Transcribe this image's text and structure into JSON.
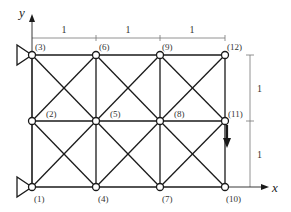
{
  "diagram": {
    "type": "truss",
    "axes": {
      "x_label": "x",
      "y_label": "y"
    },
    "nodes": [
      {
        "id": 1,
        "label": "(1)",
        "x": 32,
        "y": 187
      },
      {
        "id": 2,
        "label": "(2)",
        "x": 32,
        "y": 121
      },
      {
        "id": 3,
        "label": "(3)",
        "x": 32,
        "y": 55
      },
      {
        "id": 4,
        "label": "(4)",
        "x": 96,
        "y": 187
      },
      {
        "id": 5,
        "label": "(5)",
        "x": 96,
        "y": 121
      },
      {
        "id": 6,
        "label": "(6)",
        "x": 96,
        "y": 55
      },
      {
        "id": 7,
        "label": "(7)",
        "x": 160,
        "y": 187
      },
      {
        "id": 8,
        "label": "(8)",
        "x": 160,
        "y": 121
      },
      {
        "id": 9,
        "label": "(9)",
        "x": 160,
        "y": 55
      },
      {
        "id": 10,
        "label": "(10)",
        "x": 225,
        "y": 187
      },
      {
        "id": 11,
        "label": "(11)",
        "x": 225,
        "y": 121
      },
      {
        "id": 12,
        "label": "(12)",
        "x": 225,
        "y": 55
      }
    ],
    "dimensions": {
      "horizontal": [
        "1",
        "1",
        "1"
      ],
      "vertical": [
        "1",
        "1"
      ]
    },
    "supports": [
      {
        "node": 3,
        "type": "pin-triangle"
      },
      {
        "node": 1,
        "type": "pin-triangle"
      }
    ],
    "loads": [
      {
        "node": 11,
        "direction": "down"
      }
    ]
  }
}
